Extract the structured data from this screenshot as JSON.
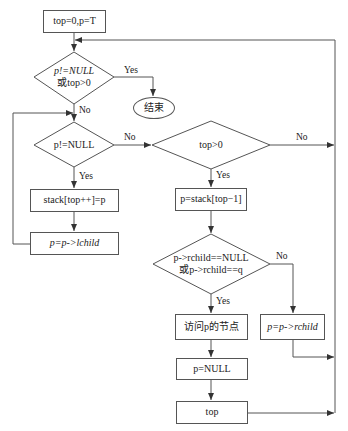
{
  "flowchart": {
    "nodes": {
      "init": {
        "text": "top=0,p=T"
      },
      "cond_loop": {
        "line1": "p!=NULL",
        "line2": "或top>0"
      },
      "end": {
        "text": "结束"
      },
      "cond_p": {
        "text": "p!=NULL"
      },
      "push": {
        "text": "stack[top++]=p"
      },
      "go_left": {
        "text": "p=p->lchild"
      },
      "cond_top": {
        "text": "top>0"
      },
      "peek": {
        "text": "p=stack[top−1]"
      },
      "cond_right": {
        "line1": "p->rchild==NULL",
        "line2": "或p->rchild==q"
      },
      "visit": {
        "text": "访问p的节点"
      },
      "go_right": {
        "text": "p=p->rchild"
      },
      "set_null": {
        "text": "p=NULL"
      },
      "pop": {
        "text": "top"
      }
    },
    "edge_labels": {
      "loop_yes": "Yes",
      "loop_no": "No",
      "p_yes": "Yes",
      "p_no": "No",
      "top_yes": "Yes",
      "top_no": "No",
      "right_yes": "Yes",
      "right_no": "No"
    },
    "colors": {
      "line": "#555555",
      "text": "#222222",
      "background": "#ffffff"
    }
  }
}
